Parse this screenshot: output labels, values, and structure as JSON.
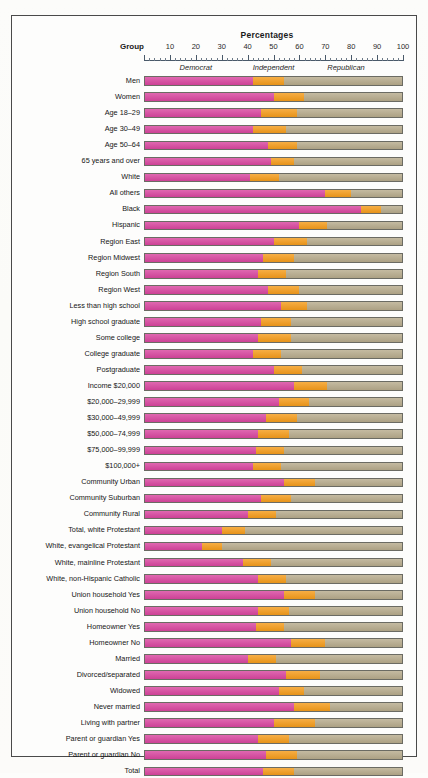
{
  "chart_title": "Percentages",
  "group_header": "Group",
  "axis": {
    "ticks": [
      10,
      20,
      30,
      40,
      50,
      60,
      70,
      80,
      90,
      100
    ],
    "min": 0,
    "max": 100
  },
  "legend": [
    {
      "label": "Democrat",
      "color": "#d9469f",
      "center": 20
    },
    {
      "label": "Independent",
      "color": "#f59c1b",
      "center": 50
    },
    {
      "label": "Republican",
      "color": "#b7ab8c",
      "center": 78
    }
  ],
  "chart_data": {
    "type": "bar",
    "subtype": "stacked-horizontal-100",
    "title": "Percentages",
    "xlabel": "Percentages",
    "ylabel": "Group",
    "xlim": [
      0,
      100
    ],
    "grid": false,
    "legend_position": "top",
    "series": [
      {
        "name": "Democrat",
        "color": "#d9469f"
      },
      {
        "name": "Independent",
        "color": "#f59c1b"
      },
      {
        "name": "Republican",
        "color": "#b7ab8c"
      }
    ],
    "categories": [
      "Men",
      "Women",
      "Age 18–29",
      "Age 30–49",
      "Age 50–64",
      "65 years and over",
      "White",
      "All others",
      "Black",
      "Hispanic",
      "Region East",
      "Region Midwest",
      "Region South",
      "Region West",
      "Less than high school",
      "High school graduate",
      "Some college",
      "College graduate",
      "Postgraduate",
      "Income $20,000",
      "$20,000–29,999",
      "$30,000–49,999",
      "$50,000–74,999",
      "$75,000–99,999",
      "$100,000+",
      "Community Urban",
      "Community Suburban",
      "Community Rural",
      "Total, white Protestant",
      "White, evangelical Protestant",
      "White, mainline Protestant",
      "White, non-Hispanic Catholic",
      "Union household Yes",
      "Union household No",
      "Homeowner Yes",
      "Homeowner No",
      "Married",
      "Divorced/separated",
      "Widowed",
      "Never married",
      "Living with partner",
      "Parent or guardian Yes",
      "Parent or guardian No",
      "Total"
    ],
    "rows": [
      {
        "category": "Men",
        "democrat": 42,
        "independent": 12,
        "republican": 46
      },
      {
        "category": "Women",
        "democrat": 50,
        "independent": 12,
        "republican": 38
      },
      {
        "category": "Age 18–29",
        "democrat": 45,
        "independent": 14,
        "republican": 41
      },
      {
        "category": "Age 30–49",
        "democrat": 42,
        "independent": 13,
        "republican": 45
      },
      {
        "category": "Age 50–64",
        "democrat": 48,
        "independent": 11,
        "republican": 41
      },
      {
        "category": "65 years and over",
        "democrat": 49,
        "independent": 9,
        "republican": 42
      },
      {
        "category": "White",
        "democrat": 41,
        "independent": 11,
        "republican": 48
      },
      {
        "category": "All others",
        "democrat": 70,
        "independent": 10,
        "republican": 20
      },
      {
        "category": "Black",
        "democrat": 84,
        "independent": 8,
        "republican": 8
      },
      {
        "category": "Hispanic",
        "democrat": 60,
        "independent": 11,
        "republican": 29
      },
      {
        "category": "Region East",
        "democrat": 50,
        "independent": 13,
        "republican": 37
      },
      {
        "category": "Region Midwest",
        "democrat": 46,
        "independent": 12,
        "republican": 42
      },
      {
        "category": "Region South",
        "democrat": 44,
        "independent": 11,
        "republican": 45
      },
      {
        "category": "Region West",
        "democrat": 48,
        "independent": 12,
        "republican": 40
      },
      {
        "category": "Less than high school",
        "democrat": 53,
        "independent": 10,
        "republican": 37
      },
      {
        "category": "High school graduate",
        "democrat": 45,
        "independent": 12,
        "republican": 43
      },
      {
        "category": "Some college",
        "democrat": 44,
        "independent": 13,
        "republican": 43
      },
      {
        "category": "College graduate",
        "democrat": 42,
        "independent": 11,
        "republican": 47
      },
      {
        "category": "Postgraduate",
        "democrat": 50,
        "independent": 11,
        "republican": 39
      },
      {
        "category": "Income $20,000",
        "democrat": 58,
        "independent": 13,
        "republican": 29
      },
      {
        "category": "$20,000–29,999",
        "democrat": 52,
        "independent": 12,
        "republican": 36
      },
      {
        "category": "$30,000–49,999",
        "democrat": 47,
        "independent": 12,
        "republican": 41
      },
      {
        "category": "$50,000–74,999",
        "democrat": 44,
        "independent": 12,
        "republican": 44
      },
      {
        "category": "$75,000–99,999",
        "democrat": 43,
        "independent": 11,
        "republican": 46
      },
      {
        "category": "$100,000+",
        "democrat": 42,
        "independent": 11,
        "republican": 47
      },
      {
        "category": "Community Urban",
        "democrat": 54,
        "independent": 12,
        "republican": 34
      },
      {
        "category": "Community Suburban",
        "democrat": 45,
        "independent": 12,
        "republican": 43
      },
      {
        "category": "Community Rural",
        "democrat": 40,
        "independent": 11,
        "republican": 49
      },
      {
        "category": "Total, white Protestant",
        "democrat": 30,
        "independent": 9,
        "republican": 61
      },
      {
        "category": "White, evangelical Protestant",
        "democrat": 22,
        "independent": 8,
        "republican": 70
      },
      {
        "category": "White, mainline Protestant",
        "democrat": 38,
        "independent": 11,
        "republican": 51
      },
      {
        "category": "White, non-Hispanic Catholic",
        "democrat": 44,
        "independent": 11,
        "republican": 45
      },
      {
        "category": "Union household Yes",
        "democrat": 54,
        "independent": 12,
        "republican": 34
      },
      {
        "category": "Union household No",
        "democrat": 44,
        "independent": 12,
        "republican": 44
      },
      {
        "category": "Homeowner Yes",
        "democrat": 43,
        "independent": 11,
        "republican": 46
      },
      {
        "category": "Homeowner No",
        "democrat": 57,
        "independent": 13,
        "republican": 30
      },
      {
        "category": "Married",
        "democrat": 40,
        "independent": 11,
        "republican": 49
      },
      {
        "category": "Divorced/separated",
        "democrat": 55,
        "independent": 13,
        "republican": 32
      },
      {
        "category": "Widowed",
        "democrat": 52,
        "independent": 10,
        "republican": 38
      },
      {
        "category": "Never married",
        "democrat": 58,
        "independent": 14,
        "republican": 28
      },
      {
        "category": "Living with partner",
        "democrat": 50,
        "independent": 16,
        "republican": 34
      },
      {
        "category": "Parent or guardian Yes",
        "democrat": 44,
        "independent": 12,
        "republican": 44
      },
      {
        "category": "Parent or guardian No",
        "democrat": 47,
        "independent": 12,
        "republican": 41
      },
      {
        "category": "Total",
        "democrat": 46,
        "independent": 12,
        "republican": 42
      }
    ]
  }
}
